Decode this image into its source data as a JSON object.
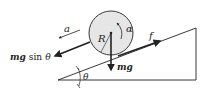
{
  "diagram": {
    "type": "free-body diagram",
    "colors": {
      "line": "#222222",
      "cylinder_fill": "#e6e6e6",
      "background": "#ffffff"
    },
    "labels": {
      "acceleration": "a",
      "angular_acceleration": "α",
      "radius": "R",
      "friction": "f",
      "weight": "mg",
      "weight_component_italic": "mg",
      "weight_component_fn": "sin",
      "weight_component_angle": "θ",
      "incline_angle": "θ"
    }
  }
}
